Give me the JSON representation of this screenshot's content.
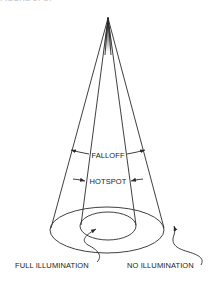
{
  "figure": {
    "title_fragment": "FIGURE 17-27",
    "labels": {
      "falloff": "FALLOFF",
      "hotspot": "HOTSPOT",
      "full_illumination": "FULL ILLUMINATION",
      "no_illumination": "NO ILLUMINATION"
    },
    "colors": {
      "stroke": "#2a2a2a",
      "text": "#222222",
      "background": "#ffffff"
    }
  }
}
